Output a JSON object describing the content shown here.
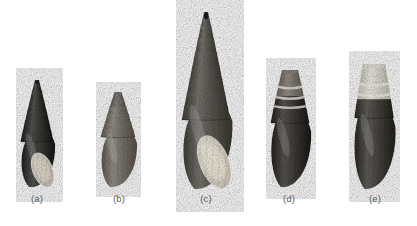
{
  "figure": {
    "kind": "photographic-plate",
    "background_color": "#ffffff",
    "width": 417,
    "height": 226,
    "panel_count": 5,
    "caption_color": "#5a5a5a"
  },
  "specimens": [
    {
      "id": "a",
      "label": "(a)",
      "shape": "elongate-conical",
      "apex_color": "#2b2a28",
      "body_color": "#3a3835",
      "aperture_color": "#cfc8b9",
      "aperture": true,
      "banded": false,
      "eroded_apex": false,
      "box": {
        "left": 16,
        "top": 80,
        "width": 42,
        "height": 108
      },
      "caption_box": {
        "left": 8,
        "top": 194,
        "width": 58
      }
    },
    {
      "id": "b",
      "label": "(b)",
      "shape": "ovate-turreted",
      "apex_color": "#6e6a63",
      "body_color": "#7a756d",
      "aperture_color": "#b9b2a6",
      "aperture": false,
      "banded": false,
      "eroded_apex": true,
      "box": {
        "left": 96,
        "top": 92,
        "width": 44,
        "height": 96
      },
      "caption_box": {
        "left": 90,
        "top": 194,
        "width": 58
      }
    },
    {
      "id": "c",
      "label": "(c)",
      "shape": "tall-turreted",
      "apex_color": "#242321",
      "body_color": "#5d5953",
      "aperture_color": "#ddd6c7",
      "aperture": true,
      "banded": false,
      "eroded_apex": false,
      "box": {
        "left": 176,
        "top": 12,
        "width": 60,
        "height": 178
      },
      "caption_box": {
        "left": 177,
        "top": 194,
        "width": 58
      }
    },
    {
      "id": "d",
      "label": "(d)",
      "shape": "ovate-conical",
      "apex_color": "#7e7870",
      "body_color": "#3d3a36",
      "aperture_color": "#3a3733",
      "aperture": false,
      "banded": true,
      "eroded_apex": true,
      "box": {
        "left": 266,
        "top": 70,
        "width": 48,
        "height": 118
      },
      "caption_box": {
        "left": 260,
        "top": 194,
        "width": 58
      }
    },
    {
      "id": "e",
      "label": "(e)",
      "shape": "ovate-truncate",
      "apex_color": "#d8d4cb",
      "body_color": "#45423d",
      "aperture_color": "#4a4742",
      "aperture": false,
      "banded": true,
      "eroded_apex": true,
      "box": {
        "left": 350,
        "top": 64,
        "width": 48,
        "height": 126
      },
      "caption_box": {
        "left": 346,
        "top": 194,
        "width": 58
      }
    }
  ]
}
